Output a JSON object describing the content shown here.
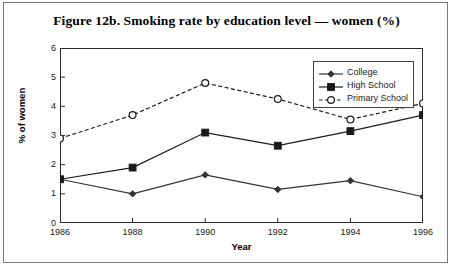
{
  "figure": {
    "title": "Figure 12b. Smoking rate by education level — women (%)",
    "border_color": "#7a7a7a"
  },
  "axes": {
    "x_title": "Year",
    "y_title": "% of women"
  },
  "legend": {
    "items": [
      {
        "label": "College",
        "marker": "diamond-marker",
        "line": "solid"
      },
      {
        "label": "High School",
        "marker": "square-marker",
        "line": "solid"
      },
      {
        "label": "Primary School",
        "marker": "circle-marker",
        "line": "dashed"
      }
    ]
  },
  "chart_data": {
    "type": "line",
    "title": "Figure 12b. Smoking rate by education level — women (%)",
    "xlabel": "Year",
    "ylabel": "% of women",
    "categories": [
      "1986",
      "1988",
      "1990",
      "1992",
      "1994",
      "1996"
    ],
    "x": [
      1986,
      1988,
      1990,
      1992,
      1994,
      1996
    ],
    "xlim": [
      1986,
      1996
    ],
    "ylim": [
      0,
      6
    ],
    "yticks": [
      0,
      1,
      2,
      3,
      4,
      5,
      6
    ],
    "ytick_labels": [
      "0",
      "1",
      "2",
      "3",
      "4",
      "5",
      "6"
    ],
    "grid": false,
    "legend_position": "top-right-inside",
    "series": [
      {
        "name": "College",
        "marker": "diamond",
        "linestyle": "solid",
        "color": "#333333",
        "values": [
          1.5,
          1.0,
          1.65,
          1.15,
          1.45,
          0.9
        ]
      },
      {
        "name": "High School",
        "marker": "square",
        "linestyle": "solid",
        "color": "#1a1a1a",
        "values": [
          1.5,
          1.9,
          3.1,
          2.65,
          3.15,
          3.7
        ]
      },
      {
        "name": "Primary School",
        "marker": "circle-open",
        "linestyle": "dashed",
        "color": "#1a1a1a",
        "values": [
          2.9,
          3.7,
          4.8,
          4.25,
          3.55,
          4.1
        ]
      }
    ]
  }
}
